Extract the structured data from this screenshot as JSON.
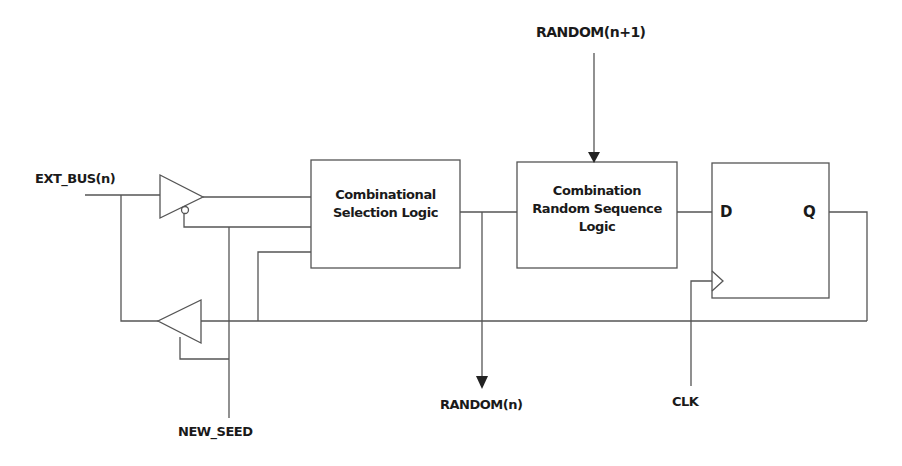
{
  "diagram": {
    "type": "block-diagram",
    "colors": {
      "line": "#555555",
      "text": "#1a1a1a",
      "background": "#ffffff"
    },
    "signals": {
      "ext_bus": "EXT_BUS(n)",
      "random_next": "RANDOM(n+1)",
      "random_out": "RANDOM(n)",
      "clk": "CLK",
      "new_seed": "NEW_SEED"
    },
    "blocks": {
      "selection_logic": {
        "line1": "Combinational",
        "line2": "Selection Logic"
      },
      "random_sequence_logic": {
        "line1": "Combination",
        "line2": "Random Sequence",
        "line3": "Logic"
      },
      "flip_flop": {
        "d_label": "D",
        "q_label": "Q"
      }
    },
    "components": [
      {
        "name": "input-tristate-buffer",
        "direction": "right",
        "enable": "active-low (NEW_SEED)"
      },
      {
        "name": "feedback-tristate-buffer",
        "direction": "left",
        "enable": "NEW_SEED"
      }
    ]
  }
}
